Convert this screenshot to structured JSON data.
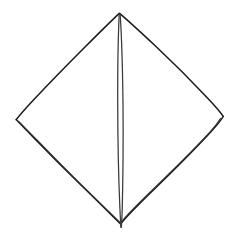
{
  "figure": {
    "background_color": "#ffffff",
    "line_color": "#1a1a1a",
    "secondary_line_color": "#2e2e2e",
    "crease_color": "#3a3a3a",
    "canvas": {
      "width": 238,
      "height": 244
    },
    "vertices": {
      "top": {
        "x": 119,
        "y": 13
      },
      "left": {
        "x": 16,
        "y": 120
      },
      "right": {
        "x": 223,
        "y": 121
      },
      "bottom": {
        "x": 122,
        "y": 228
      }
    },
    "crease": {
      "name": "vertical-centre-fold",
      "top": {
        "x": 119,
        "y": 14
      },
      "bottom": {
        "x": 121,
        "y": 228
      },
      "line_count": 2,
      "left_line_x_mid": 118,
      "right_line_x_mid": 123
    },
    "edges": [
      {
        "name": "top-left-edge",
        "from": "top",
        "to": "left",
        "line_count": 1
      },
      {
        "name": "top-right-edge",
        "from": "top",
        "to": "right",
        "line_count": 1
      },
      {
        "name": "bottom-left-edge",
        "from": "left",
        "to": "bottom",
        "line_count": 2
      },
      {
        "name": "bottom-right-edge",
        "from": "right",
        "to": "bottom",
        "line_count": 2
      }
    ],
    "paths": {
      "outline_upper_left": "M 119.0 13.6 C 110.0 22.0 98.0 34.0 84.0 48.0 C 68.5 63.5 48.5 84.0 33.0 100.5 C 25.0 109.0 19.5 115.5 16.2 119.6",
      "outline_upper_right": "M 119.6 13.4 C 128.5 21.0 141.0 32.5 156.0 46.5 C 172.0 61.5 192.0 81.5 207.5 98.0 C 216.0 107.0 221.0 113.0 223.2 116.3",
      "outline_lower_left_outer": "M 16.2 119.6 C 19.0 122.6 25.0 128.8 33.5 137.5 C 48.0 152.5 67.5 172.0 83.5 187.5 C 99.5 203.0 113.0 216.5 120.6 224.0",
      "outline_lower_left_inner": "M 18.6 121.3 C 22.0 124.6 28.0 130.8 36.5 139.5 C 50.5 154.0 69.0 172.8 84.5 188.0 C 100.0 203.0 113.5 216.0 121.0 223.5",
      "outline_lower_right_outer": "M 223.2 116.5 C 221.5 119.5 216.0 126.5 207.5 135.5 C 192.5 151.5 172.0 172.0 156.0 187.5 C 140.0 203.0 127.5 215.5 121.8 222.5",
      "outline_lower_right_inner": "M 220.4 118.5 C 218.5 121.8 213.0 129.0 204.5 138.0 C 190.0 153.5 170.0 173.0 154.5 188.0 C 139.0 203.0 127.0 215.0 121.4 222.0",
      "crease_left": "M 119.2 14.4 C 118.2 36.0 117.6 70.0 117.7 104.0 C 117.8 140.0 118.6 178.0 119.8 206.0 C 120.3 217.5 120.6 224.0 120.8 227.2",
      "crease_right": "M 120.2 14.6 C 121.6 36.0 122.6 70.0 123.0 104.0 C 123.3 140.0 123.0 178.0 122.3 206.0 C 122.0 217.5 121.6 224.0 121.3 227.4"
    }
  }
}
